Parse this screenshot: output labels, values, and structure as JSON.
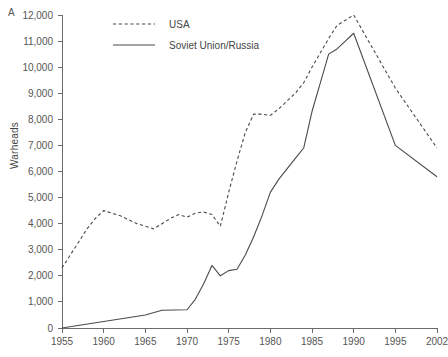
{
  "panel": {
    "label": "A"
  },
  "axes": {
    "ylabel": "Warheads",
    "xlabel": "",
    "y_ticks": [
      "0",
      "1,000",
      "2,000",
      "3,000",
      "4,000",
      "5,000",
      "6,000",
      "7,000",
      "8,000",
      "9,000",
      "10,000",
      "11,000",
      "12,000"
    ],
    "x_ticks": [
      "1955",
      "1960",
      "1965",
      "1970",
      "1975",
      "1980",
      "1985",
      "1990",
      "1995",
      "2002"
    ]
  },
  "legend": {
    "items": [
      {
        "label": "USA",
        "style": "dashed"
      },
      {
        "label": "Soviet Union/Russia",
        "style": "solid"
      }
    ]
  },
  "colors": {
    "line": "#4a4a4a",
    "axis": "#6b6b6b",
    "text": "#555555",
    "background": "#ffffff"
  },
  "chart_data": {
    "type": "line",
    "title": "",
    "xlabel": "",
    "ylabel": "Warheads",
    "xlim": [
      1955,
      2002
    ],
    "ylim": [
      0,
      12000
    ],
    "grid": false,
    "legend_position": "top-center",
    "xticks": [
      1955,
      1960,
      1965,
      1970,
      1975,
      1980,
      1985,
      1990,
      1995,
      2002
    ],
    "yticks": [
      0,
      1000,
      2000,
      3000,
      4000,
      5000,
      6000,
      7000,
      8000,
      9000,
      10000,
      11000,
      12000
    ],
    "series": [
      {
        "name": "USA",
        "style": "dashed",
        "x": [
          1955,
          1956,
          1957,
          1958,
          1959,
          1960,
          1961,
          1962,
          1963,
          1964,
          1965,
          1966,
          1967,
          1968,
          1969,
          1970,
          1971,
          1972,
          1973,
          1974,
          1975,
          1976,
          1977,
          1978,
          1979,
          1980,
          1981,
          1982,
          1983,
          1984,
          1985,
          1986,
          1987,
          1988,
          1989,
          1990,
          1995,
          2002
        ],
        "y": [
          2300,
          2800,
          3300,
          3800,
          4200,
          4500,
          4400,
          4300,
          4150,
          4000,
          3900,
          3800,
          4000,
          4200,
          4350,
          4250,
          4400,
          4450,
          4350,
          3900,
          5200,
          6400,
          7500,
          8200,
          8200,
          8150,
          8400,
          8700,
          9000,
          9400,
          10000,
          10550,
          11100,
          11600,
          11800,
          12000,
          9200,
          6900
        ]
      },
      {
        "name": "Soviet Union/Russia",
        "style": "solid",
        "x": [
          1955,
          1960,
          1965,
          1967,
          1970,
          1971,
          1972,
          1973,
          1974,
          1975,
          1976,
          1977,
          1978,
          1979,
          1980,
          1981,
          1982,
          1983,
          1984,
          1985,
          1986,
          1987,
          1988,
          1989,
          1990,
          1995,
          2002
        ],
        "y": [
          0,
          250,
          500,
          680,
          700,
          1100,
          1700,
          2400,
          2000,
          2200,
          2250,
          2800,
          3500,
          4300,
          5200,
          5700,
          6100,
          6500,
          6900,
          8300,
          9400,
          10500,
          10700,
          11000,
          11300,
          7000,
          5800
        ]
      }
    ]
  }
}
